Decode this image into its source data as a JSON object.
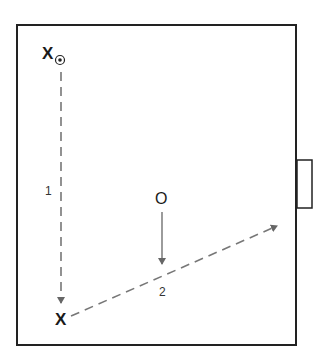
{
  "diagram": {
    "type": "soccer-drill",
    "field": {
      "border_color": "#222222",
      "background": "#ffffff"
    },
    "goal": {
      "side": "right"
    },
    "players": [
      {
        "id": "attacker-start",
        "symbol": "X",
        "has_ball": true
      },
      {
        "id": "attacker-end",
        "symbol": "X",
        "has_ball": false
      },
      {
        "id": "defender",
        "symbol": "O"
      }
    ],
    "ball_icon": "⊛",
    "movements": [
      {
        "label": "1",
        "style": "dashed",
        "description": "Attacker dribbles down the left side"
      },
      {
        "label": "2",
        "style": "dashed",
        "description": "Pass/cross toward the goal"
      },
      {
        "label": "",
        "style": "solid",
        "description": "Defender moves to intercept"
      }
    ],
    "colors": {
      "dashed_line": "#777777",
      "solid_line": "#666666",
      "text": "#1a1a1a"
    }
  }
}
